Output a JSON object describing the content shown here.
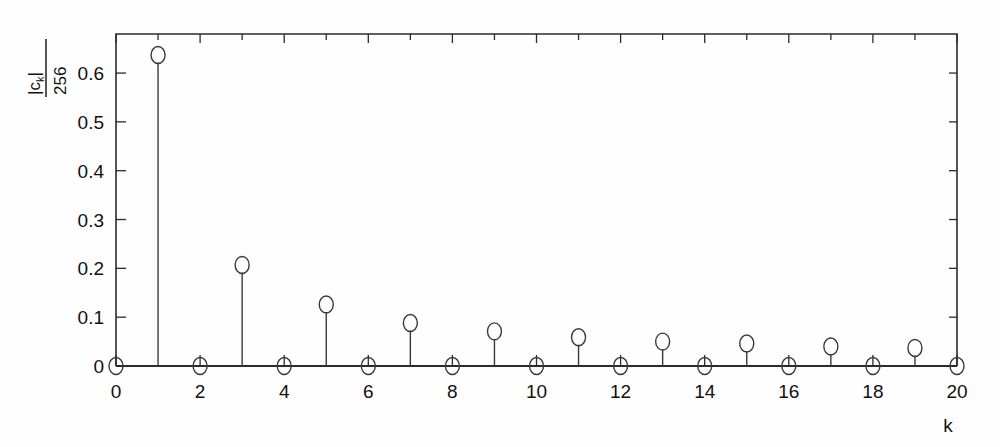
{
  "figure": {
    "title": "",
    "xlabel": "k",
    "ylabel_numerator": "|c",
    "ylabel_numerator_sub": "k",
    "ylabel_numerator_tail": "|",
    "ylabel_denominator": "256"
  },
  "chart_data": {
    "type": "scatter",
    "style": "stem",
    "title": "",
    "xlabel": "k",
    "ylabel": "|c_k|/256",
    "xlim": [
      0,
      20
    ],
    "ylim": [
      0,
      0.68
    ],
    "grid": false,
    "legend": false,
    "x_major_ticks": [
      0,
      2,
      4,
      6,
      8,
      10,
      12,
      14,
      16,
      18,
      20
    ],
    "x_minor_ticks": [
      1,
      3,
      5,
      7,
      9,
      11,
      13,
      15,
      17,
      19
    ],
    "x_tick_labels": [
      "0",
      "2",
      "4",
      "6",
      "8",
      "10",
      "12",
      "14",
      "16",
      "18",
      "20"
    ],
    "y_major_ticks": [
      0,
      0.1,
      0.2,
      0.3,
      0.4,
      0.5,
      0.6
    ],
    "y_tick_labels": [
      "0",
      "0.1",
      "0.2",
      "0.3",
      "0.4",
      "0.5",
      "0.6"
    ],
    "marker": "circle-open",
    "x": [
      0,
      1,
      2,
      3,
      4,
      5,
      6,
      7,
      8,
      9,
      10,
      11,
      12,
      13,
      14,
      15,
      16,
      17,
      18,
      19,
      20
    ],
    "values": [
      0.0,
      0.637,
      0.0,
      0.207,
      0.0,
      0.126,
      0.0,
      0.088,
      0.0,
      0.071,
      0.0,
      0.059,
      0.0,
      0.05,
      0.0,
      0.046,
      0.0,
      0.04,
      0.0,
      0.037,
      0.0
    ]
  },
  "colors": {
    "background": "#fefefe",
    "axis": "#2b2b2b",
    "stem": "#3a3a3a",
    "text": "#111111"
  }
}
